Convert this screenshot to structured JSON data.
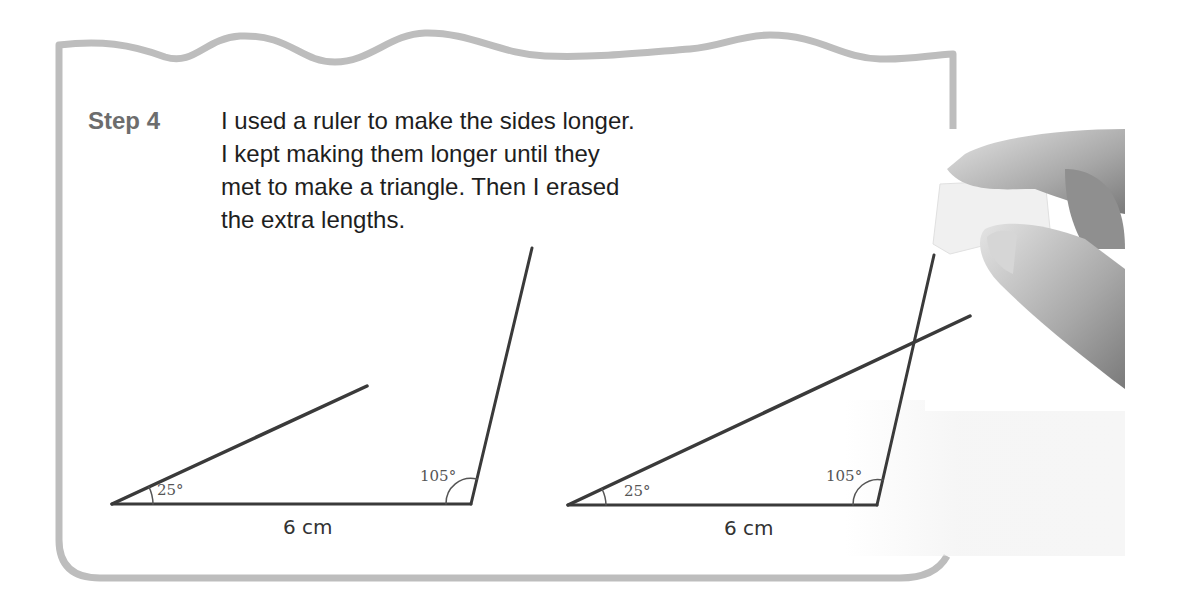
{
  "step": {
    "label": "Step 4",
    "lines": [
      "I used a ruler to make the sides longer.",
      "I kept making them longer until they",
      "met to make a triangle. Then I erased",
      "the extra lengths."
    ]
  },
  "diagrams": [
    {
      "name": "before",
      "angle_left": "25°",
      "angle_right": "105°",
      "base_length": "6 cm"
    },
    {
      "name": "after",
      "angle_left": "25°",
      "angle_right": "105°",
      "base_length": "6 cm"
    }
  ],
  "photo": {
    "icon": "hand-holding-eraser-icon"
  },
  "colors": {
    "frame": "#bdbdbd",
    "step_label": "#6d6d6d",
    "text": "#1e1e1e",
    "line": "#3a3a3a"
  }
}
